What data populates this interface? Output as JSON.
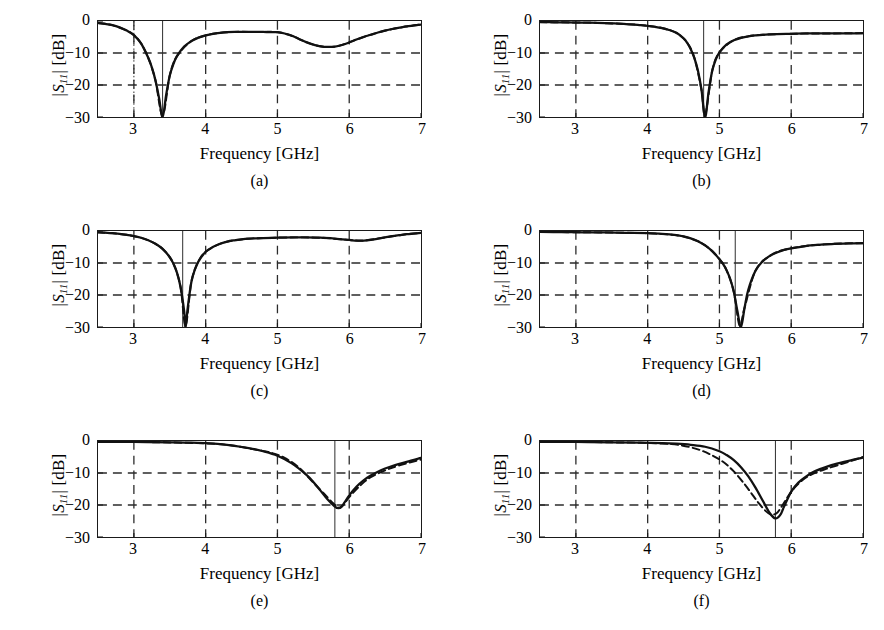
{
  "figure": {
    "axis_label_y": "|S11| [dB]",
    "axis_label_x": "Frequency [GHz]",
    "y_ticks": [
      "0",
      "−10",
      "−20",
      "−30"
    ],
    "y_tick_values": [
      0,
      -10,
      -20,
      -30
    ],
    "x_ticks": [
      "3",
      "4",
      "5",
      "6",
      "7"
    ],
    "x_tick_values": [
      3,
      4,
      5,
      6,
      7
    ],
    "xlim": [
      2.5,
      7.0
    ],
    "ylim": [
      -30,
      0
    ],
    "gridlines_y": [
      -10,
      -20
    ],
    "gridlines_x": [
      3,
      4,
      5,
      6
    ],
    "curve_color": "#111111",
    "grid_color": "#2b2b2b",
    "frame_color": "#1a1a1a",
    "captions": [
      "(a)",
      "(b)",
      "(c)",
      "(d)",
      "(e)",
      "(f)"
    ]
  },
  "chart_data": [
    {
      "type": "line",
      "title": "(a)",
      "xlabel": "Frequency [GHz]",
      "ylabel": "|S11| [dB]",
      "xlim": [
        2.5,
        7.0
      ],
      "ylim": [
        -30,
        0
      ],
      "grid": true,
      "legend": [],
      "annotations": [
        {
          "type": "vertical-marker",
          "style": "solid",
          "x": 3.4
        },
        {
          "type": "vertical-marker",
          "style": "dotted",
          "x": 3.0
        }
      ],
      "resonance_ghz": 3.4,
      "resonance_depth_db": -30,
      "series": [
        {
          "name": "measured",
          "style": "solid",
          "x": [
            2.5,
            2.6,
            2.7,
            2.8,
            2.9,
            3.0,
            3.1,
            3.2,
            3.25,
            3.3,
            3.35,
            3.4,
            3.45,
            3.5,
            3.55,
            3.6,
            3.7,
            3.8,
            3.9,
            4.0,
            4.1,
            4.2,
            4.3,
            4.4,
            4.5,
            4.6,
            4.7,
            4.8,
            4.9,
            5.0,
            5.1,
            5.2,
            5.3,
            5.4,
            5.5,
            5.6,
            5.7,
            5.8,
            5.9,
            6.0,
            6.1,
            6.2,
            6.3,
            6.4,
            6.5,
            6.6,
            6.7,
            6.8,
            6.9,
            7.0
          ],
          "y": [
            -0.6,
            -0.9,
            -1.3,
            -2.0,
            -3.0,
            -4.4,
            -7.0,
            -11.5,
            -14.5,
            -18.5,
            -24.0,
            -30.0,
            -23.0,
            -17.0,
            -13.5,
            -11.0,
            -8.0,
            -6.3,
            -5.2,
            -4.5,
            -4.0,
            -3.7,
            -3.5,
            -3.4,
            -3.4,
            -3.4,
            -3.4,
            -3.4,
            -3.5,
            -3.5,
            -3.9,
            -4.6,
            -5.6,
            -6.6,
            -7.4,
            -7.9,
            -8.1,
            -8.0,
            -7.5,
            -6.7,
            -5.8,
            -5.0,
            -4.3,
            -3.6,
            -3.0,
            -2.5,
            -2.1,
            -1.7,
            -1.4,
            -1.1
          ]
        },
        {
          "name": "simulated",
          "style": "dashed",
          "x": [
            2.5,
            2.7,
            2.9,
            3.0,
            3.1,
            3.2,
            3.3,
            3.4,
            3.5,
            3.6,
            3.8,
            4.0,
            4.2,
            4.4,
            4.6,
            4.8,
            5.0,
            5.2,
            5.4,
            5.6,
            5.8,
            6.0,
            6.2,
            6.4,
            6.6,
            6.8,
            7.0
          ],
          "y": [
            -0.6,
            -1.3,
            -3.0,
            -4.4,
            -7.0,
            -11.5,
            -18.5,
            -29.5,
            -17.0,
            -11.0,
            -6.3,
            -4.5,
            -3.7,
            -3.4,
            -3.4,
            -3.4,
            -3.5,
            -4.6,
            -6.6,
            -7.9,
            -8.0,
            -6.7,
            -5.0,
            -3.6,
            -2.5,
            -1.7,
            -1.1
          ]
        }
      ]
    },
    {
      "type": "line",
      "title": "(b)",
      "xlabel": "Frequency [GHz]",
      "ylabel": "|S11| [dB]",
      "xlim": [
        2.5,
        7.0
      ],
      "ylim": [
        -30,
        0
      ],
      "grid": true,
      "legend": [],
      "annotations": [
        {
          "type": "vertical-marker",
          "style": "solid",
          "x": 4.78
        }
      ],
      "resonance_ghz": 4.8,
      "resonance_depth_db": -30,
      "series": [
        {
          "name": "measured",
          "style": "solid",
          "x": [
            2.5,
            2.7,
            2.9,
            3.1,
            3.3,
            3.5,
            3.7,
            3.9,
            4.0,
            4.1,
            4.2,
            4.3,
            4.4,
            4.5,
            4.55,
            4.6,
            4.65,
            4.7,
            4.75,
            4.8,
            4.85,
            4.9,
            4.95,
            5.0,
            5.1,
            5.2,
            5.3,
            5.4,
            5.5,
            5.6,
            5.8,
            6.0,
            6.2,
            6.4,
            6.6,
            6.8,
            7.0
          ],
          "y": [
            -0.35,
            -0.4,
            -0.45,
            -0.5,
            -0.6,
            -0.75,
            -0.95,
            -1.3,
            -1.5,
            -1.8,
            -2.2,
            -2.8,
            -3.7,
            -5.4,
            -6.8,
            -8.8,
            -11.5,
            -15.5,
            -21.5,
            -30.0,
            -22.0,
            -15.5,
            -12.0,
            -9.8,
            -7.3,
            -6.0,
            -5.3,
            -4.8,
            -4.5,
            -4.3,
            -4.1,
            -4.0,
            -3.9,
            -3.9,
            -3.85,
            -3.85,
            -3.8
          ]
        },
        {
          "name": "simulated",
          "style": "dashed",
          "x": [
            2.5,
            2.9,
            3.3,
            3.7,
            4.0,
            4.2,
            4.4,
            4.55,
            4.65,
            4.75,
            4.8,
            4.9,
            5.0,
            5.2,
            5.4,
            5.6,
            6.0,
            6.4,
            6.8,
            7.0
          ],
          "y": [
            -0.35,
            -0.45,
            -0.6,
            -0.95,
            -1.5,
            -2.2,
            -3.7,
            -6.8,
            -11.5,
            -21.5,
            -29.5,
            -15.5,
            -9.8,
            -6.0,
            -4.8,
            -4.3,
            -4.0,
            -3.9,
            -3.85,
            -3.8
          ]
        }
      ]
    },
    {
      "type": "line",
      "title": "(c)",
      "xlabel": "Frequency [GHz]",
      "ylabel": "|S11| [dB]",
      "xlim": [
        2.5,
        7.0
      ],
      "ylim": [
        -30,
        0
      ],
      "grid": true,
      "legend": [],
      "annotations": [
        {
          "type": "vertical-marker",
          "style": "solid",
          "x": 3.68
        }
      ],
      "resonance_ghz": 3.72,
      "resonance_depth_db": -30,
      "series": [
        {
          "name": "measured",
          "style": "solid",
          "x": [
            2.5,
            2.6,
            2.7,
            2.8,
            2.9,
            3.0,
            3.1,
            3.2,
            3.3,
            3.4,
            3.5,
            3.55,
            3.6,
            3.65,
            3.7,
            3.72,
            3.75,
            3.8,
            3.85,
            3.9,
            4.0,
            4.1,
            4.2,
            4.3,
            4.4,
            4.5,
            4.6,
            4.7,
            4.8,
            5.0,
            5.2,
            5.4,
            5.6,
            5.8,
            6.0,
            6.1,
            6.2,
            6.3,
            6.4,
            6.5,
            6.6,
            6.7,
            6.8,
            6.9,
            7.0
          ],
          "y": [
            -0.4,
            -0.5,
            -0.7,
            -0.9,
            -1.2,
            -1.6,
            -2.1,
            -2.9,
            -4.0,
            -5.6,
            -8.2,
            -10.2,
            -13.0,
            -17.5,
            -25.0,
            -30.0,
            -24.0,
            -16.0,
            -12.0,
            -9.5,
            -6.5,
            -5.0,
            -4.0,
            -3.3,
            -2.9,
            -2.6,
            -2.4,
            -2.3,
            -2.2,
            -2.1,
            -2.0,
            -2.0,
            -2.1,
            -2.4,
            -2.8,
            -3.0,
            -3.0,
            -2.8,
            -2.4,
            -2.0,
            -1.6,
            -1.3,
            -1.0,
            -0.8,
            -0.6
          ]
        },
        {
          "name": "simulated",
          "style": "dashed",
          "x": [
            2.5,
            2.8,
            3.0,
            3.2,
            3.4,
            3.55,
            3.65,
            3.72,
            3.8,
            3.9,
            4.0,
            4.2,
            4.4,
            4.6,
            4.8,
            5.2,
            5.6,
            6.0,
            6.2,
            6.5,
            6.8,
            7.0
          ],
          "y": [
            -0.4,
            -0.9,
            -1.6,
            -2.9,
            -5.6,
            -10.2,
            -17.5,
            -29.5,
            -16.0,
            -9.5,
            -6.5,
            -4.0,
            -2.9,
            -2.4,
            -2.2,
            -2.0,
            -2.1,
            -2.8,
            -3.0,
            -2.0,
            -1.0,
            -0.6
          ]
        }
      ]
    },
    {
      "type": "line",
      "title": "(d)",
      "xlabel": "Frequency [GHz]",
      "ylabel": "|S11| [dB]",
      "xlim": [
        2.5,
        7.0
      ],
      "ylim": [
        -30,
        0
      ],
      "grid": true,
      "legend": [],
      "annotations": [
        {
          "type": "vertical-marker",
          "style": "solid",
          "x": 5.22
        }
      ],
      "resonance_ghz": 5.3,
      "resonance_depth_db": -30,
      "series": [
        {
          "name": "measured",
          "style": "solid",
          "x": [
            2.5,
            2.8,
            3.1,
            3.4,
            3.7,
            4.0,
            4.2,
            4.4,
            4.5,
            4.6,
            4.7,
            4.8,
            4.9,
            5.0,
            5.05,
            5.1,
            5.15,
            5.2,
            5.25,
            5.3,
            5.35,
            5.4,
            5.5,
            5.6,
            5.7,
            5.8,
            5.9,
            6.0,
            6.2,
            6.4,
            6.6,
            6.8,
            7.0
          ],
          "y": [
            -0.3,
            -0.35,
            -0.4,
            -0.45,
            -0.55,
            -0.7,
            -0.9,
            -1.3,
            -1.7,
            -2.3,
            -3.2,
            -4.5,
            -6.3,
            -8.8,
            -10.3,
            -12.3,
            -15.0,
            -19.0,
            -25.0,
            -30.0,
            -24.0,
            -18.5,
            -12.5,
            -9.5,
            -7.8,
            -6.7,
            -5.9,
            -5.4,
            -4.7,
            -4.3,
            -4.0,
            -3.9,
            -3.8
          ]
        },
        {
          "name": "simulated",
          "style": "dashed",
          "x": [
            2.5,
            3.1,
            3.7,
            4.0,
            4.3,
            4.5,
            4.7,
            4.85,
            5.0,
            5.1,
            5.2,
            5.28,
            5.35,
            5.5,
            5.7,
            5.9,
            6.2,
            6.6,
            7.0
          ],
          "y": [
            -0.3,
            -0.4,
            -0.55,
            -0.7,
            -1.1,
            -1.7,
            -3.2,
            -5.3,
            -8.8,
            -12.3,
            -19.0,
            -29.5,
            -24.0,
            -12.5,
            -7.8,
            -5.9,
            -4.7,
            -4.0,
            -3.8
          ]
        }
      ]
    },
    {
      "type": "line",
      "title": "(e)",
      "xlabel": "Frequency [GHz]",
      "ylabel": "|S11| [dB]",
      "xlim": [
        2.5,
        7.0
      ],
      "ylim": [
        -30,
        0
      ],
      "grid": true,
      "legend": [],
      "annotations": [
        {
          "type": "vertical-marker",
          "style": "solid",
          "x": 5.8
        }
      ],
      "resonance_ghz": 5.85,
      "resonance_depth_db": -21,
      "series": [
        {
          "name": "measured",
          "style": "solid",
          "x": [
            2.5,
            3.0,
            3.5,
            3.8,
            4.0,
            4.2,
            4.4,
            4.6,
            4.8,
            5.0,
            5.2,
            5.4,
            5.5,
            5.6,
            5.7,
            5.8,
            5.85,
            5.9,
            6.0,
            6.1,
            6.2,
            6.3,
            6.4,
            6.5,
            6.6,
            6.8,
            7.0
          ],
          "y": [
            -0.25,
            -0.3,
            -0.4,
            -0.5,
            -0.7,
            -1.0,
            -1.5,
            -2.2,
            -3.2,
            -4.6,
            -7.0,
            -10.5,
            -12.8,
            -15.5,
            -18.3,
            -20.5,
            -21.0,
            -20.3,
            -17.0,
            -14.3,
            -12.3,
            -10.8,
            -9.6,
            -8.6,
            -7.8,
            -6.5,
            -5.3
          ]
        },
        {
          "name": "simulated",
          "style": "dashed",
          "x": [
            2.5,
            3.0,
            3.5,
            4.0,
            4.3,
            4.6,
            4.9,
            5.1,
            5.3,
            5.5,
            5.65,
            5.78,
            5.88,
            6.0,
            6.15,
            6.3,
            6.5,
            6.7,
            7.0
          ],
          "y": [
            -0.25,
            -0.3,
            -0.45,
            -0.75,
            -1.2,
            -2.3,
            -3.6,
            -5.3,
            -8.3,
            -13.0,
            -16.5,
            -19.5,
            -20.8,
            -17.5,
            -14.0,
            -11.3,
            -9.2,
            -7.6,
            -5.8
          ]
        }
      ]
    },
    {
      "type": "line",
      "title": "(f)",
      "xlabel": "Frequency [GHz]",
      "ylabel": "|S11| [dB]",
      "xlim": [
        2.5,
        7.0
      ],
      "ylim": [
        -30,
        0
      ],
      "grid": true,
      "legend": [],
      "annotations": [
        {
          "type": "vertical-marker",
          "style": "solid",
          "x": 5.78
        }
      ],
      "resonance_ghz": 5.82,
      "resonance_depth_db": -24,
      "series": [
        {
          "name": "measured",
          "style": "solid",
          "x": [
            2.5,
            3.0,
            3.5,
            3.9,
            4.2,
            4.4,
            4.6,
            4.8,
            5.0,
            5.1,
            5.2,
            5.3,
            5.4,
            5.5,
            5.6,
            5.7,
            5.78,
            5.85,
            5.9,
            6.0,
            6.1,
            6.2,
            6.3,
            6.4,
            6.5,
            6.6,
            6.8,
            7.0
          ],
          "y": [
            -0.25,
            -0.3,
            -0.4,
            -0.5,
            -0.65,
            -0.85,
            -1.2,
            -1.8,
            -3.2,
            -4.4,
            -6.0,
            -8.2,
            -11.0,
            -14.5,
            -18.5,
            -22.5,
            -24.2,
            -23.0,
            -20.5,
            -15.8,
            -13.0,
            -11.2,
            -9.8,
            -8.8,
            -8.0,
            -7.3,
            -6.2,
            -5.2
          ]
        },
        {
          "name": "simulated",
          "style": "dashed",
          "x": [
            2.5,
            3.0,
            3.5,
            3.9,
            4.2,
            4.45,
            4.7,
            4.9,
            5.05,
            5.2,
            5.35,
            5.45,
            5.55,
            5.65,
            5.72,
            5.8,
            5.88,
            5.95,
            6.05,
            6.2,
            6.35,
            6.5,
            6.7,
            6.85,
            7.0
          ],
          "y": [
            -0.25,
            -0.3,
            -0.42,
            -0.55,
            -0.8,
            -1.3,
            -2.6,
            -4.5,
            -6.5,
            -9.5,
            -13.5,
            -16.5,
            -19.5,
            -22.0,
            -23.0,
            -22.5,
            -20.0,
            -17.5,
            -14.5,
            -11.5,
            -9.8,
            -8.6,
            -7.2,
            -6.1,
            -5.0
          ]
        }
      ]
    }
  ]
}
